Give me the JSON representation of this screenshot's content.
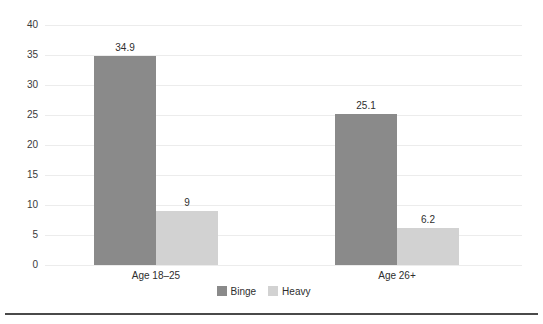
{
  "chart_data": {
    "type": "bar",
    "title": "",
    "categories": [
      "Age 18–25",
      "Age 26+"
    ],
    "series": [
      {
        "name": "Binge",
        "color": "#8a8a8a",
        "values": [
          34.9,
          25.1
        ],
        "value_labels": [
          "34.9",
          "25.1"
        ]
      },
      {
        "name": "Heavy",
        "color": "#d2d2d2",
        "values": [
          9,
          6.2
        ],
        "value_labels": [
          "9",
          "6.2"
        ]
      }
    ],
    "xlabel": "",
    "ylabel": "",
    "ylim": [
      0,
      40
    ],
    "yticks": [
      0,
      5,
      10,
      15,
      20,
      25,
      30,
      35,
      40
    ],
    "grid": true,
    "legend_position": "bottom"
  },
  "colors": {
    "background": "#ffffff",
    "gridline": "#ececec",
    "tick_text": "#3a3a3a",
    "label_text": "#2e2e2e",
    "bottom_rule": "#4a4a4a"
  }
}
